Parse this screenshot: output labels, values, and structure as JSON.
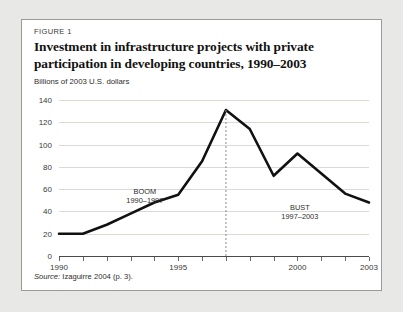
{
  "figure": {
    "label": "FIGURE 1",
    "title": "Investment in infrastructure projects with private participation in developing countries, 1990–2003",
    "axis_note": "Billions of 2003 U.S. dollars",
    "source": "Source: Izaguirre 2004 (p. 3)."
  },
  "chart_data": {
    "type": "line",
    "title": "Investment in infrastructure projects with private participation in developing countries, 1990–2003",
    "xlabel": "",
    "ylabel": "Billions of 2003 U.S. dollars",
    "x": [
      1990,
      1991,
      1992,
      1993,
      1994,
      1995,
      1996,
      1997,
      1998,
      1999,
      2000,
      2001,
      2002,
      2003
    ],
    "values": [
      20,
      20,
      28,
      38,
      48,
      55,
      85,
      131,
      114,
      72,
      92,
      74,
      56,
      48
    ],
    "xlim": [
      1990,
      2003
    ],
    "ylim": [
      0,
      140
    ],
    "yticks": [
      0,
      20,
      40,
      60,
      80,
      100,
      120,
      140
    ],
    "xticks": [
      1990,
      1991,
      1992,
      1993,
      1994,
      1995,
      1996,
      1997,
      1998,
      1999,
      2000,
      2001,
      2002,
      2003
    ],
    "xtick_labels": [
      "1990",
      "",
      "",
      "",
      "",
      "1995",
      "",
      "",
      "",
      "",
      "2000",
      "",
      "",
      "2003"
    ],
    "grid": true,
    "legend": "none",
    "line_color": "#111111",
    "marker_line": {
      "x": 1997,
      "style": "dashed",
      "color": "#8a8a88"
    },
    "annotations": [
      {
        "line1": "BOOM",
        "line2": "1990–1997",
        "x": 1993.6,
        "y": 62
      },
      {
        "line1": "BUST",
        "line2": "1997–2003",
        "x": 2000.1,
        "y": 48
      }
    ]
  },
  "ytick_labels": [
    "140",
    "120",
    "100",
    "80",
    "60",
    "40",
    "20",
    "0"
  ]
}
